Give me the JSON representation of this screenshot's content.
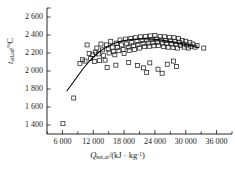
{
  "chart_data": {
    "type": "scatter",
    "title": "",
    "xlabel": "Q_net,ar /(kJ · kg^-1)",
    "ylabel": "t_ad,ad /°C",
    "xlabel_symbol": "Q",
    "xlabel_sub": "net,ar",
    "xlabel_units": "/(kJ · kg",
    "xlabel_unit_exp": "-1",
    "xlabel_units_close": ")",
    "ylabel_symbol": "t",
    "ylabel_sub": "ad,ad",
    "ylabel_units": "/°C",
    "xlim": [
      3000,
      39000
    ],
    "ylim": [
      1300,
      2700
    ],
    "xticks_major": [
      6000,
      12000,
      18000,
      24000,
      30000,
      36000
    ],
    "xticks_labels": [
      "6 000",
      "12 000",
      "18 000",
      "24 000",
      "30 000",
      "36 000"
    ],
    "xticks_minor_step": 3000,
    "yticks": [
      1400,
      1600,
      1800,
      2000,
      2200,
      2400,
      2600
    ],
    "yticks_labels": [
      "1 400",
      "1 600",
      "1 800",
      "2 000",
      "2 200",
      "2 400",
      "2 600"
    ],
    "grid": false,
    "legend": false,
    "marker": "open-square",
    "marker_size": 4,
    "marker_color": "#202020",
    "curve_color": "#000000",
    "series": [
      {
        "name": "measured",
        "marker": "open-square",
        "points": [
          [
            6100,
            1415
          ],
          [
            8200,
            1700
          ],
          [
            9400,
            2085
          ],
          [
            9900,
            2125
          ],
          [
            10400,
            2110
          ],
          [
            10800,
            2290
          ],
          [
            11200,
            2195
          ],
          [
            11500,
            2140
          ],
          [
            11900,
            2180
          ],
          [
            12200,
            2105
          ],
          [
            12400,
            2210
          ],
          [
            12700,
            2255
          ],
          [
            13000,
            2190
          ],
          [
            13200,
            2115
          ],
          [
            13500,
            2300
          ],
          [
            13800,
            2235
          ],
          [
            14000,
            2170
          ],
          [
            14300,
            2120
          ],
          [
            14600,
            2290
          ],
          [
            14900,
            2245
          ],
          [
            15100,
            2200
          ],
          [
            15400,
            2330
          ],
          [
            15700,
            2265
          ],
          [
            15900,
            2215
          ],
          [
            16200,
            2180
          ],
          [
            16500,
            2310
          ],
          [
            16700,
            2260
          ],
          [
            17000,
            2225
          ],
          [
            17200,
            2345
          ],
          [
            17500,
            2290
          ],
          [
            17800,
            2240
          ],
          [
            18000,
            2195
          ],
          [
            18300,
            2355
          ],
          [
            18500,
            2300
          ],
          [
            18800,
            2265
          ],
          [
            19000,
            2230
          ],
          [
            19300,
            2360
          ],
          [
            19500,
            2315
          ],
          [
            19800,
            2280
          ],
          [
            20000,
            2240
          ],
          [
            20200,
            2370
          ],
          [
            20500,
            2330
          ],
          [
            20700,
            2295
          ],
          [
            21000,
            2255
          ],
          [
            21200,
            2380
          ],
          [
            21500,
            2340
          ],
          [
            21700,
            2305
          ],
          [
            22000,
            2270
          ],
          [
            22200,
            2385
          ],
          [
            22400,
            2345
          ],
          [
            22700,
            2310
          ],
          [
            22900,
            2275
          ],
          [
            23100,
            2390
          ],
          [
            23400,
            2350
          ],
          [
            23600,
            2315
          ],
          [
            23800,
            2280
          ],
          [
            24000,
            2395
          ],
          [
            24300,
            2355
          ],
          [
            24500,
            2320
          ],
          [
            24700,
            2285
          ],
          [
            25000,
            2385
          ],
          [
            25200,
            2345
          ],
          [
            25400,
            2310
          ],
          [
            25700,
            2270
          ],
          [
            25900,
            2380
          ],
          [
            26100,
            2340
          ],
          [
            26300,
            2305
          ],
          [
            26600,
            2265
          ],
          [
            26800,
            2375
          ],
          [
            27000,
            2335
          ],
          [
            27200,
            2300
          ],
          [
            27500,
            2260
          ],
          [
            27700,
            2370
          ],
          [
            27900,
            2330
          ],
          [
            28100,
            2295
          ],
          [
            28400,
            2255
          ],
          [
            28600,
            2360
          ],
          [
            28800,
            2320
          ],
          [
            29000,
            2285
          ],
          [
            29300,
            2340
          ],
          [
            29500,
            2300
          ],
          [
            29700,
            2265
          ],
          [
            30000,
            2330
          ],
          [
            30200,
            2290
          ],
          [
            30500,
            2255
          ],
          [
            30800,
            2315
          ],
          [
            31000,
            2275
          ],
          [
            31400,
            2300
          ],
          [
            31800,
            2265
          ],
          [
            32200,
            2285
          ],
          [
            20600,
            2060
          ],
          [
            21800,
            2035
          ],
          [
            23000,
            2090
          ],
          [
            24600,
            2020
          ],
          [
            26400,
            2075
          ],
          [
            28200,
            2050
          ],
          [
            22400,
            1985
          ],
          [
            25400,
            1975
          ],
          [
            18900,
            2095
          ],
          [
            16400,
            2065
          ],
          [
            14700,
            2040
          ],
          [
            33500,
            2255
          ],
          [
            27600,
            2110
          ]
        ]
      }
    ],
    "fit_curve": {
      "name": "fitted trend",
      "points": [
        [
          6900,
          1780
        ],
        [
          8500,
          1905
        ],
        [
          10000,
          2025
        ],
        [
          11500,
          2125
        ],
        [
          13000,
          2205
        ],
        [
          14500,
          2265
        ],
        [
          16000,
          2305
        ],
        [
          17500,
          2332
        ],
        [
          19000,
          2348
        ],
        [
          20500,
          2356
        ],
        [
          22000,
          2358
        ],
        [
          23500,
          2354
        ],
        [
          25000,
          2346
        ],
        [
          26500,
          2334
        ],
        [
          28000,
          2318
        ],
        [
          29500,
          2300
        ],
        [
          31000,
          2280
        ],
        [
          32500,
          2258
        ]
      ]
    }
  }
}
